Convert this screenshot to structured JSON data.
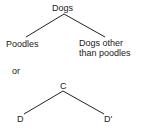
{
  "diagram1": {
    "root": "Dogs",
    "left_child": "Poodles",
    "right_child_line1": "Dogs other",
    "right_child_line2": "than poodles"
  },
  "separator": "or",
  "diagram2": {
    "root": "C",
    "left_child": "D",
    "right_child": "D'"
  },
  "colors": {
    "line": "#222222",
    "background": "#ffffff"
  }
}
